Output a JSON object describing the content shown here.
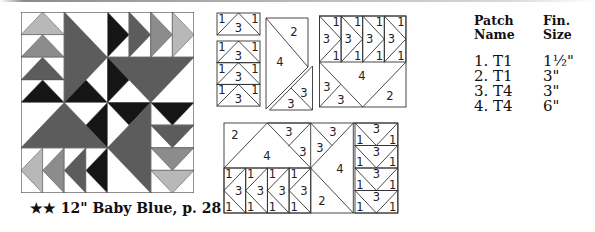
{
  "caption": "★★ 12\" Baby Blue, p. 28",
  "colors": {
    "light": "#b8b8b8",
    "medium": "#8c8c8c",
    "dark": "#5c5c5c",
    "black": "#151515",
    "white": "#ffffff",
    "outline": "#555555"
  },
  "table": {
    "headers": {
      "patch_line1": "Patch",
      "patch_line2": "Name",
      "size_line1": "Fin.",
      "size_line2": "Size"
    },
    "rows": [
      {
        "patch": "1. T1",
        "size": "1½\""
      },
      {
        "patch": "2. T1",
        "size": "3\""
      },
      {
        "patch": "3. T4",
        "size": "3\""
      },
      {
        "patch": "4. T4",
        "size": "6\""
      }
    ]
  },
  "diagram_labels": {
    "one": "1",
    "two": "2",
    "three": "3",
    "four": "4"
  }
}
